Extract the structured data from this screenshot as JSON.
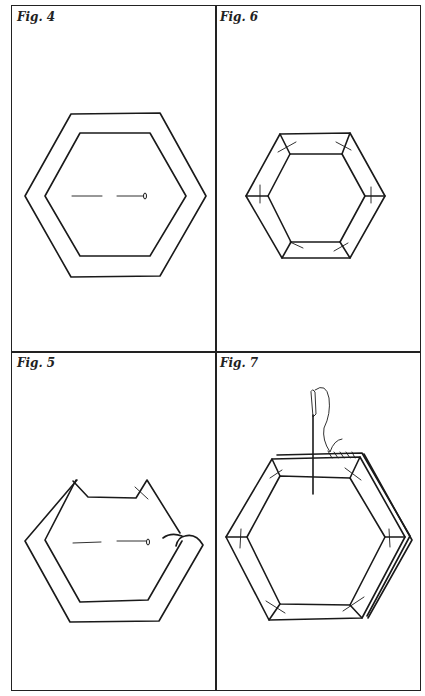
{
  "panels": [
    {
      "id": "fig4",
      "label": "Fig. 4",
      "description": "Paper hexagon template basted inside larger fabric hexagon with seam allowance; tacking stitch through center"
    },
    {
      "id": "fig6",
      "label": "Fig. 6",
      "description": "All six sides of fabric folded over template and tacked at corners"
    },
    {
      "id": "fig5",
      "label": "Fig. 5",
      "description": "Seam allowance being folded over template edges one side at a time"
    },
    {
      "id": "fig7",
      "label": "Fig. 7",
      "description": "Two covered hexagons placed right sides together and whipstitched along one edge with needle and thread"
    }
  ],
  "colors": {
    "ink": "#1a1a1a",
    "background": "#ffffff"
  }
}
